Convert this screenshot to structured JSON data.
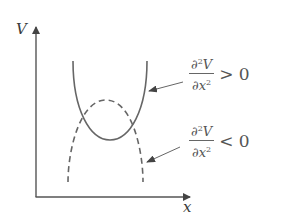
{
  "axes": {
    "y_label": "V",
    "x_label": "x"
  },
  "curves": [
    {
      "name": "stable",
      "style": "solid",
      "shape": "upward parabola (minimum)"
    },
    {
      "name": "unstable",
      "style": "dashed",
      "shape": "downward parabola (maximum)"
    }
  ],
  "annotations": {
    "upper": {
      "partial": "∂",
      "power": "2",
      "var": "V",
      "den_partial": "∂",
      "den_var": "x",
      "den_power": "2",
      "relation": "> 0"
    },
    "lower": {
      "partial": "∂",
      "power": "2",
      "var": "V",
      "den_partial": "∂",
      "den_var": "x",
      "den_power": "2",
      "relation": "< 0"
    }
  },
  "colors": {
    "axis": "#444444",
    "curve": "#555555",
    "text": "#555555"
  }
}
